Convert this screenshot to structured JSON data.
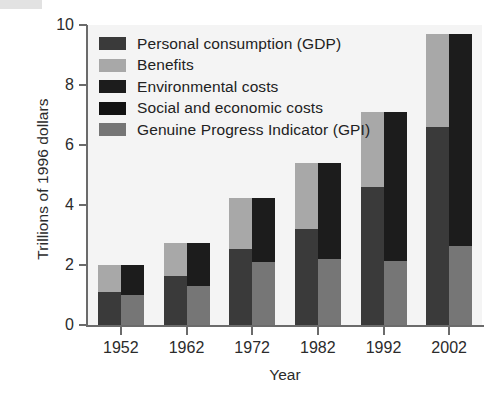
{
  "chart_data": {
    "type": "bar",
    "title": "",
    "xlabel": "Year",
    "ylabel": "Trillions of 1996 dollars",
    "categories": [
      "1952",
      "1962",
      "1972",
      "1982",
      "1992",
      "2002"
    ],
    "ylim": [
      0,
      10
    ],
    "yticks": [
      0,
      2,
      4,
      6,
      8,
      10
    ],
    "ytick_labels": [
      "0",
      "2",
      "4",
      "6",
      "8",
      "10"
    ],
    "grid": false,
    "legend_position": "upper-left-inside",
    "bar_groups": [
      {
        "name": "GDP bar",
        "description": "left bar of each pair: Personal consumption (GDP) bottom, Benefits on top",
        "series": [
          {
            "name": "Personal consumption (GDP)",
            "color": "#3a3a3a",
            "values": [
              1.1,
              1.65,
              2.55,
              3.2,
              4.6,
              6.6
            ]
          },
          {
            "name": "Benefits",
            "color": "#a8a8a8",
            "values": [
              0.9,
              1.1,
              1.7,
              2.2,
              2.5,
              3.1
            ]
          }
        ],
        "totals": [
          2.0,
          2.75,
          4.25,
          5.4,
          7.1,
          9.7
        ]
      },
      {
        "name": "Cost bar",
        "description": "right bar of each pair: Genuine Progress Indicator (GPI) bottom, then Environmental / Social and economic costs on top",
        "series": [
          {
            "name": "Genuine Progress Indicator (GPI)",
            "color": "#767676",
            "values": [
              1.0,
              1.3,
              2.1,
              2.2,
              2.15,
              2.65
            ]
          },
          {
            "name": "Environmental and social / economic costs",
            "color": "#1c1c1c",
            "values": [
              1.0,
              1.45,
              2.15,
              3.2,
              4.95,
              7.05
            ]
          }
        ],
        "totals": [
          2.0,
          2.75,
          4.25,
          5.4,
          7.1,
          9.7
        ]
      }
    ],
    "legend": [
      {
        "label": "Personal consumption (GDP)",
        "color": "#3a3a3a"
      },
      {
        "label": "Benefits",
        "color": "#a8a8a8"
      },
      {
        "label": "Environmental costs",
        "color": "#1c1c1c"
      },
      {
        "label": "Social and economic costs",
        "color": "#121212"
      },
      {
        "label": "Genuine Progress Indicator (GPI)",
        "color": "#767676"
      }
    ],
    "colors": {
      "plot_background": "#f4f4f4",
      "figure_background": "#ffffff",
      "axis": "#6b6b6b",
      "text": "#2b2b2b",
      "personal_consumption": "#3a3a3a",
      "benefits": "#a8a8a8",
      "environmental_costs": "#1c1c1c",
      "social_economic_costs": "#121212",
      "gpi": "#767676"
    }
  }
}
